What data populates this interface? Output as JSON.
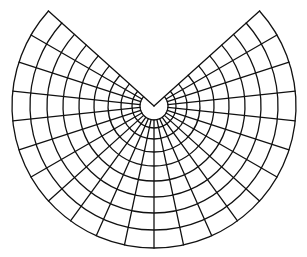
{
  "map": {
    "type": "conic-projection-graticule",
    "background": "#ffffff",
    "line_color": "#111111",
    "center": [
      154,
      106
    ],
    "inner_radius": 14,
    "parallel_radii": [
      22,
      33,
      46,
      60,
      75,
      91,
      107,
      124,
      142
    ],
    "sector_half_gap_deg": 48,
    "meridian_count": 23
  }
}
